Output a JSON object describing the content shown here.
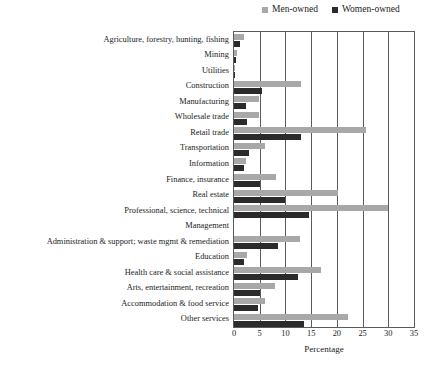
{
  "chart_data": {
    "type": "bar",
    "orientation": "horizontal",
    "title": "",
    "xlabel": "Percentage",
    "ylabel": "",
    "xlim": [
      0,
      35
    ],
    "xticks": [
      0,
      5,
      10,
      15,
      20,
      25,
      30,
      35
    ],
    "grid": true,
    "legend_position": "top-right",
    "categories": [
      "Agriculture, forestry, hunting, fishing",
      "Mining",
      "Utilities",
      "Construction",
      "Manufacturing",
      "Wholesale trade",
      "Retail trade",
      "Transportation",
      "Information",
      "Finance, insurance",
      "Real estate",
      "Professional, science, technical",
      "Management",
      "Administration & support; waste mgmt & remediation",
      "Education",
      "Health care & social assistance",
      "Arts, entertainment, recreation",
      "Accommodation & food service",
      "Other services"
    ],
    "series": [
      {
        "name": "Men-owned",
        "color": "#a8a8a8",
        "values": [
          2.0,
          0.6,
          0.2,
          13.0,
          4.8,
          4.9,
          25.6,
          6.0,
          2.4,
          8.1,
          20.2,
          30.0,
          0.0,
          12.8,
          2.6,
          17.0,
          8.0,
          6.0,
          22.2
        ]
      },
      {
        "name": "Women-owned",
        "color": "#2b2b2b",
        "values": [
          1.2,
          0.4,
          0.1,
          5.4,
          2.4,
          2.6,
          13.1,
          3.0,
          1.9,
          5.0,
          10.0,
          14.6,
          0.0,
          8.5,
          2.0,
          12.5,
          5.0,
          4.6,
          13.6
        ]
      }
    ]
  },
  "legend": {
    "entries": [
      {
        "label": "Men-owned",
        "color": "#a8a8a8"
      },
      {
        "label": "Women-owned",
        "color": "#2b2b2b"
      }
    ]
  }
}
